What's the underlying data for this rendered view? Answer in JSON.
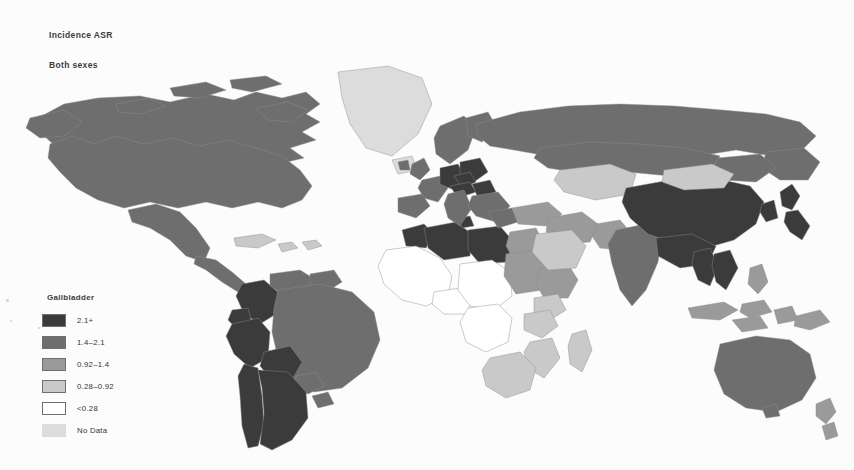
{
  "figure": {
    "title_incidence": "Incidence ASR",
    "title_sexes": "Both sexes",
    "background_color": "#fcfcfc"
  },
  "legend": {
    "title": "Gallbladder",
    "items": [
      {
        "label": "2.1+",
        "color": "#3b3b3b",
        "bordered": true,
        "name": "legend-swatch-highest"
      },
      {
        "label": "1.4–2.1",
        "color": "#6e6e6e",
        "bordered": true,
        "name": "legend-swatch-high"
      },
      {
        "label": "0.92–1.4",
        "color": "#9a9a9a",
        "bordered": true,
        "name": "legend-swatch-medium"
      },
      {
        "label": "0.28–0.92",
        "color": "#c9c9c9",
        "bordered": true,
        "name": "legend-swatch-low"
      },
      {
        "label": "<0.28",
        "color": "#ffffff",
        "bordered": true,
        "name": "legend-swatch-lowest"
      },
      {
        "label": "No Data",
        "color": "#dcdcdc",
        "bordered": false,
        "name": "legend-swatch-no-data"
      }
    ]
  },
  "chart_data": {
    "type": "heatmap",
    "title": "Incidence ASR",
    "subtitle": "Both sexes",
    "legend_title": "Gallbladder",
    "legend_position": "bottom-left",
    "map_projection": "world-equirectangular",
    "grid": false,
    "xlabel": "",
    "ylabel": "",
    "categories": [
      "2.1+",
      "1.4–2.1",
      "0.92–1.4",
      "0.28–0.92",
      "<0.28",
      "No Data"
    ],
    "category_colors": [
      "#3b3b3b",
      "#6e6e6e",
      "#9a9a9a",
      "#c9c9c9",
      "#ffffff",
      "#dcdcdc"
    ],
    "units": "age-standardised rate per 100,000",
    "regions": [
      {
        "name": "Canada",
        "category": "1.4–2.1"
      },
      {
        "name": "United States",
        "category": "1.4–2.1"
      },
      {
        "name": "Greenland",
        "category": "No Data"
      },
      {
        "name": "Mexico",
        "category": "1.4–2.1"
      },
      {
        "name": "Central America",
        "category": "1.4–2.1"
      },
      {
        "name": "Caribbean",
        "category": "0.28–0.92"
      },
      {
        "name": "Colombia",
        "category": "2.1+"
      },
      {
        "name": "Ecuador",
        "category": "2.1+"
      },
      {
        "name": "Peru",
        "category": "2.1+"
      },
      {
        "name": "Bolivia",
        "category": "2.1+"
      },
      {
        "name": "Chile",
        "category": "2.1+"
      },
      {
        "name": "Argentina",
        "category": "2.1+"
      },
      {
        "name": "Brazil",
        "category": "1.4–2.1"
      },
      {
        "name": "Venezuela",
        "category": "1.4–2.1"
      },
      {
        "name": "Guyana region",
        "category": "1.4–2.1"
      },
      {
        "name": "Paraguay",
        "category": "1.4–2.1"
      },
      {
        "name": "Uruguay",
        "category": "1.4–2.1"
      },
      {
        "name": "Morocco",
        "category": "2.1+"
      },
      {
        "name": "Algeria",
        "category": "2.1+"
      },
      {
        "name": "Libya",
        "category": "2.1+"
      },
      {
        "name": "Egypt",
        "category": "0.92–1.4"
      },
      {
        "name": "Tunisia",
        "category": "2.1+"
      },
      {
        "name": "West Africa",
        "category": "<0.28"
      },
      {
        "name": "Central Africa",
        "category": "<0.28"
      },
      {
        "name": "Sudan",
        "category": "0.92–1.4"
      },
      {
        "name": "Ethiopia",
        "category": "0.92–1.4"
      },
      {
        "name": "Kenya",
        "category": "0.28–0.92"
      },
      {
        "name": "Tanzania",
        "category": "0.28–0.92"
      },
      {
        "name": "Mozambique",
        "category": "0.28–0.92"
      },
      {
        "name": "Madagascar",
        "category": "0.28–0.92"
      },
      {
        "name": "South Africa",
        "category": "0.28–0.92"
      },
      {
        "name": "Scandinavia",
        "category": "1.4–2.1"
      },
      {
        "name": "United Kingdom",
        "category": "1.4–2.1"
      },
      {
        "name": "Germany",
        "category": "2.1+"
      },
      {
        "name": "Poland",
        "category": "2.1+"
      },
      {
        "name": "Czechia",
        "category": "2.1+"
      },
      {
        "name": "Austria",
        "category": "2.1+"
      },
      {
        "name": "Hungary",
        "category": "2.1+"
      },
      {
        "name": "Italy",
        "category": "1.4–2.1"
      },
      {
        "name": "Spain",
        "category": "1.4–2.1"
      },
      {
        "name": "France",
        "category": "1.4–2.1"
      },
      {
        "name": "Balkans",
        "category": "1.4–2.1"
      },
      {
        "name": "Turkey",
        "category": "0.92–1.4"
      },
      {
        "name": "Russia",
        "category": "1.4–2.1"
      },
      {
        "name": "Kazakhstan",
        "category": "0.28–0.92"
      },
      {
        "name": "Saudi Arabia",
        "category": "0.28–0.92"
      },
      {
        "name": "Iran",
        "category": "0.92–1.4"
      },
      {
        "name": "India",
        "category": "1.4–2.1"
      },
      {
        "name": "Pakistan",
        "category": "0.92–1.4"
      },
      {
        "name": "China",
        "category": "2.1+"
      },
      {
        "name": "Mongolia",
        "category": "0.28–0.92"
      },
      {
        "name": "Japan",
        "category": "2.1+"
      },
      {
        "name": "Korea",
        "category": "2.1+"
      },
      {
        "name": "Thailand",
        "category": "2.1+"
      },
      {
        "name": "Vietnam",
        "category": "2.1+"
      },
      {
        "name": "Indonesia",
        "category": "0.92–1.4"
      },
      {
        "name": "Philippines",
        "category": "0.92–1.4"
      },
      {
        "name": "Papua New Guinea",
        "category": "0.92–1.4"
      },
      {
        "name": "Australia",
        "category": "1.4–2.1"
      },
      {
        "name": "New Zealand",
        "category": "0.92–1.4"
      }
    ]
  }
}
